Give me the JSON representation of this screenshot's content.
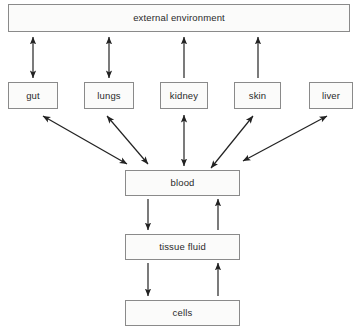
{
  "diagram": {
    "stroke_color": "#222222",
    "box_fill": "#fbfbfa",
    "box_border": "#8a8a8a",
    "nodes": {
      "external": "external environment",
      "gut": "gut",
      "lungs": "lungs",
      "kidney": "kidney",
      "skin": "skin",
      "liver": "liver",
      "blood": "blood",
      "tissue_fluid": "tissue fluid",
      "cells": "cells"
    },
    "connections": [
      {
        "from": "gut",
        "to": "external",
        "direction": "both"
      },
      {
        "from": "lungs",
        "to": "external",
        "direction": "both"
      },
      {
        "from": "kidney",
        "to": "external",
        "direction": "up"
      },
      {
        "from": "skin",
        "to": "external",
        "direction": "up"
      },
      {
        "from": "gut",
        "to": "blood",
        "direction": "both"
      },
      {
        "from": "lungs",
        "to": "blood",
        "direction": "both"
      },
      {
        "from": "kidney",
        "to": "blood",
        "direction": "both"
      },
      {
        "from": "skin",
        "to": "blood",
        "direction": "both"
      },
      {
        "from": "liver",
        "to": "blood",
        "direction": "both"
      },
      {
        "from": "blood",
        "to": "tissue_fluid",
        "direction": "down"
      },
      {
        "from": "tissue_fluid",
        "to": "blood",
        "direction": "up"
      },
      {
        "from": "tissue_fluid",
        "to": "cells",
        "direction": "down"
      },
      {
        "from": "cells",
        "to": "tissue_fluid",
        "direction": "up"
      }
    ]
  }
}
